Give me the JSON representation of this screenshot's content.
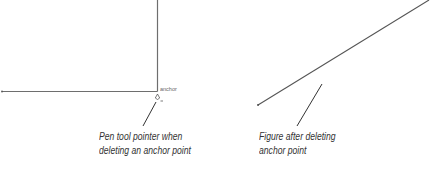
{
  "left_figure": {
    "point_label": "anchor",
    "caption_lines": [
      "Pen tool pointer when",
      "deleting an anchor point"
    ]
  },
  "right_figure": {
    "caption_lines": [
      "Figure after deleting",
      "anchor point"
    ]
  },
  "colors": {
    "line": "#6e6e6e",
    "leader": "#333333",
    "text": "#333333"
  }
}
